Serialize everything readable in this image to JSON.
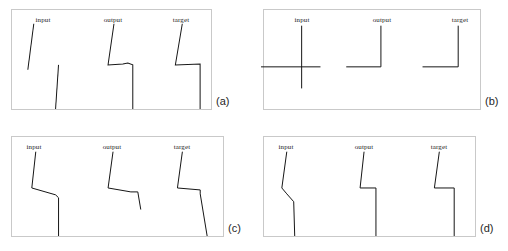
{
  "figure": {
    "background": "#ffffff",
    "stroke_color": "#161616",
    "panel_border_color": "#c9c9c9",
    "series_names": [
      "input",
      "output",
      "target"
    ],
    "panels": [
      {
        "caption": "(a)",
        "series": [
          {
            "name": "input",
            "label_x": 31,
            "label_y": 6,
            "polylines": [
              [
                [
                  22,
                  14
                ],
                [
                  16,
                  61
                ]
              ],
              [
                [
                  47,
                  56
                ],
                [
                  44,
                  101
                ]
              ]
            ]
          },
          {
            "name": "output",
            "label_x": 101,
            "label_y": 6,
            "polylines": [
              [
                [
                  103,
                  14
                ],
                [
                  97,
                  56
                ],
                [
                  112,
                  55
                ],
                [
                  117,
                  54
                ],
                [
                  122,
                  56
                ],
                [
                  122,
                  101
                ]
              ]
            ]
          },
          {
            "name": "target",
            "label_x": 169,
            "label_y": 6,
            "polylines": [
              [
                [
                  172,
                  14
                ],
                [
                  165,
                  56
                ],
                [
                  190,
                  55
                ],
                [
                  190,
                  101
                ]
              ]
            ]
          }
        ]
      },
      {
        "caption": "(b)",
        "series": [
          {
            "name": "input",
            "label_x": 38,
            "label_y": 6,
            "polylines": [
              [
                [
                  38,
                  16
                ],
                [
                  38,
                  80
                ]
              ],
              [
                [
                  -3,
                  58
                ],
                [
                  57,
                  58
                ]
              ]
            ]
          },
          {
            "name": "output",
            "label_x": 118,
            "label_y": 6,
            "polylines": [
              [
                [
                  118,
                  16
                ],
                [
                  118,
                  58
                ],
                [
                  83,
                  58
                ]
              ]
            ]
          },
          {
            "name": "target",
            "label_x": 196,
            "label_y": 6,
            "polylines": [
              [
                [
                  196,
                  16
                ],
                [
                  196,
                  58
                ],
                [
                  160,
                  58
                ]
              ]
            ]
          }
        ]
      },
      {
        "caption": "(c)",
        "series": [
          {
            "name": "input",
            "label_x": 22,
            "label_y": 6,
            "polylines": [
              [
                [
                  24,
                  15
                ],
                [
                  20,
                  52
                ],
                [
                  44,
                  59
                ],
                [
                  47,
                  62
                ],
                [
                  47,
                  101
                ]
              ]
            ]
          },
          {
            "name": "output",
            "label_x": 100,
            "label_y": 6,
            "polylines": [
              [
                [
                  102,
                  15
                ],
                [
                  97,
                  52
                ],
                [
                  120,
                  56
                ],
                [
                  127,
                  56
                ],
                [
                  130,
                  74
                ]
              ]
            ]
          },
          {
            "name": "target",
            "label_x": 170,
            "label_y": 6,
            "polylines": [
              [
                [
                  172,
                  15
                ],
                [
                  167,
                  52
                ],
                [
                  190,
                  54
                ],
                [
                  190,
                  58
                ],
                [
                  197,
                  101
                ]
              ]
            ]
          }
        ]
      },
      {
        "caption": "(d)",
        "series": [
          {
            "name": "input",
            "label_x": 22,
            "label_y": 6,
            "polylines": [
              [
                [
                  23,
                  15
                ],
                [
                  18,
                  52
                ],
                [
                  23,
                  58
                ],
                [
                  30,
                  66
                ],
                [
                  31,
                  101
                ]
              ]
            ]
          },
          {
            "name": "output",
            "label_x": 100,
            "label_y": 6,
            "polylines": [
              [
                [
                  101,
                  15
                ],
                [
                  97,
                  52
                ],
                [
                  113,
                  52
                ],
                [
                  113,
                  101
                ]
              ]
            ]
          },
          {
            "name": "target",
            "label_x": 175,
            "label_y": 6,
            "polylines": [
              [
                [
                  177,
                  15
                ],
                [
                  172,
                  52
                ],
                [
                  192,
                  52
                ],
                [
                  192,
                  101
                ]
              ]
            ]
          }
        ]
      }
    ]
  }
}
